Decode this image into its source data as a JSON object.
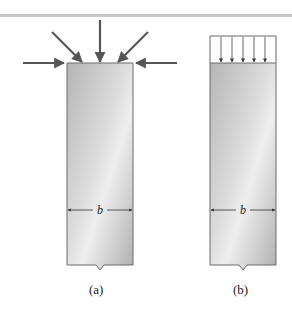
{
  "figure": {
    "panels": [
      {
        "id": "a",
        "caption": "(a)",
        "load_type": "concentrated forces (five arrows: horizontal left, diagonal, vertical, diagonal, horizontal right)",
        "dimension_label": "b"
      },
      {
        "id": "b",
        "caption": "(b)",
        "load_type": "uniformly distributed load (five vertical arrows)",
        "dimension_label": "b"
      }
    ]
  },
  "colors": {
    "arrow": "#555555",
    "column_light": "#e6e6e6",
    "column_dark": "#a9a9a9",
    "outline": "#6a6a6a",
    "rule": "#c8c8c8"
  }
}
